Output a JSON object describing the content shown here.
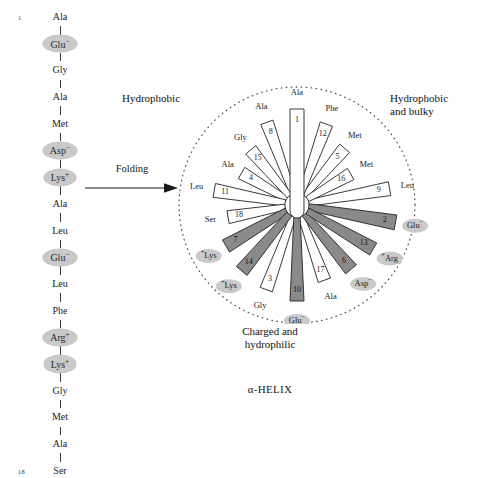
{
  "linear_chain": {
    "title": "LINEAR CHAIN",
    "first_index": "1",
    "last_index": "18",
    "residues": [
      {
        "n": 1,
        "name": "Ala",
        "charge": "",
        "highlight": false
      },
      {
        "n": 2,
        "name": "Glu",
        "charge": "−",
        "highlight": true
      },
      {
        "n": 3,
        "name": "Gly",
        "charge": "",
        "highlight": false
      },
      {
        "n": 4,
        "name": "Ala",
        "charge": "",
        "highlight": false
      },
      {
        "n": 5,
        "name": "Met",
        "charge": "",
        "highlight": false
      },
      {
        "n": 6,
        "name": "Asp",
        "charge": "−",
        "highlight": true
      },
      {
        "n": 7,
        "name": "Lys",
        "charge": "+",
        "highlight": true
      },
      {
        "n": 8,
        "name": "Ala",
        "charge": "",
        "highlight": false
      },
      {
        "n": 9,
        "name": "Leu",
        "charge": "",
        "highlight": false
      },
      {
        "n": 10,
        "name": "Glu",
        "charge": "−",
        "highlight": true
      },
      {
        "n": 11,
        "name": "Leu",
        "charge": "",
        "highlight": false
      },
      {
        "n": 12,
        "name": "Phe",
        "charge": "",
        "highlight": false
      },
      {
        "n": 13,
        "name": "Arg",
        "charge": "+",
        "highlight": true
      },
      {
        "n": 14,
        "name": "Lys",
        "charge": "+",
        "highlight": true
      },
      {
        "n": 15,
        "name": "Gly",
        "charge": "",
        "highlight": false
      },
      {
        "n": 16,
        "name": "Met",
        "charge": "",
        "highlight": false
      },
      {
        "n": 17,
        "name": "Ala",
        "charge": "",
        "highlight": false
      },
      {
        "n": 18,
        "name": "Ser",
        "charge": "",
        "highlight": false
      }
    ]
  },
  "folding": {
    "label": "Folding",
    "arrow_icon": "right-arrow-icon"
  },
  "helix": {
    "title": "α-HELIX",
    "zones": {
      "hydrophobic": "Hydrophobic",
      "bulky": "Hydrophobic\nand bulky",
      "bulky_line1": "Hydrophobic",
      "bulky_line2": "and bulky",
      "charged_line1": "Charged and",
      "charged_line2": "hydrophilic"
    },
    "colors": {
      "charged_fill": "#8a8a8a",
      "neutral_fill": "#ffffff",
      "stroke": "#222222",
      "oval_fill": "#c9c9c9",
      "dotted_circle": "#555555"
    }
  },
  "chart_data": {
    "type": "helical-wheel",
    "title": "α-HELIX",
    "center": {
      "x": 131,
      "y": 143
    },
    "residues_per_turn": 3.6,
    "degrees_per_residue": 100,
    "spokes": [
      {
        "n": 1,
        "label": "Ala",
        "charge": "",
        "angle": -90,
        "len": 96,
        "half_w": 7.0,
        "charged": false,
        "outer_r": 112
      },
      {
        "n": 2,
        "label": "Glu",
        "charge": "−",
        "angle": 10,
        "len": 100,
        "half_w": 7.5,
        "charged": true,
        "outer_r": 120
      },
      {
        "n": 3,
        "label": "Gly",
        "charge": "",
        "angle": 110,
        "len": 90,
        "half_w": 6.5,
        "charged": false,
        "outer_r": 108
      },
      {
        "n": 4,
        "label": "Ala",
        "charge": "",
        "angle": -150,
        "len": 64,
        "half_w": 6.5,
        "charged": false,
        "outer_r": 80
      },
      {
        "n": 5,
        "label": "Met",
        "charge": "",
        "angle": -50,
        "len": 74,
        "half_w": 6.5,
        "charged": false,
        "outer_r": 90
      },
      {
        "n": 6,
        "label": "Asp",
        "charge": "−",
        "angle": 50,
        "len": 84,
        "half_w": 7.0,
        "charged": true,
        "outer_r": 103
      },
      {
        "n": 7,
        "label": "Lys",
        "charge": "+",
        "angle": 150,
        "len": 82,
        "half_w": 7.0,
        "charged": true,
        "outer_r": 102
      },
      {
        "n": 8,
        "label": "Ala",
        "charge": "",
        "angle": -110,
        "len": 88,
        "half_w": 6.5,
        "charged": false,
        "outer_r": 104
      },
      {
        "n": 9,
        "label": "Leu",
        "charge": "",
        "angle": -10,
        "len": 94,
        "half_w": 7.0,
        "charged": false,
        "outer_r": 112
      },
      {
        "n": 10,
        "label": "Glu",
        "charge": "−",
        "angle": 90,
        "len": 96,
        "half_w": 7.0,
        "charged": true,
        "outer_r": 116
      },
      {
        "n": 11,
        "label": "Leu",
        "charge": "",
        "angle": -170,
        "len": 84,
        "half_w": 7.0,
        "charged": false,
        "outer_r": 102
      },
      {
        "n": 12,
        "label": "Phe",
        "charge": "",
        "angle": -70,
        "len": 86,
        "half_w": 6.5,
        "charged": false,
        "outer_r": 102
      },
      {
        "n": 13,
        "label": "Arg",
        "charge": "+",
        "angle": 30,
        "len": 88,
        "half_w": 7.0,
        "charged": true,
        "outer_r": 107
      },
      {
        "n": 14,
        "label": "Lys",
        "charge": "+",
        "angle": 130,
        "len": 86,
        "half_w": 7.0,
        "charged": true,
        "outer_r": 106
      },
      {
        "n": 15,
        "label": "Gly",
        "charge": "",
        "angle": -130,
        "len": 72,
        "half_w": 6.5,
        "charged": false,
        "outer_r": 88
      },
      {
        "n": 16,
        "label": "Met",
        "charge": "",
        "angle": -30,
        "len": 62,
        "half_w": 6.5,
        "charged": false,
        "outer_r": 80
      },
      {
        "n": 17,
        "label": "Ala",
        "charge": "",
        "angle": 70,
        "len": 80,
        "half_w": 6.5,
        "charged": false,
        "outer_r": 98
      },
      {
        "n": 18,
        "label": "Ser",
        "charge": "",
        "angle": 170,
        "len": 70,
        "half_w": 6.5,
        "charged": false,
        "outer_r": 88
      }
    ]
  }
}
